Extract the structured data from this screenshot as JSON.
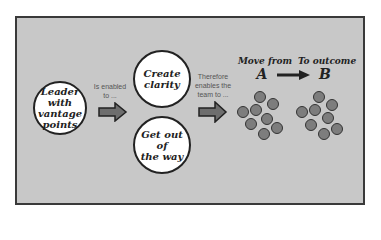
{
  "diagram": {
    "leader": {
      "line1": "Leader with",
      "line2": "vantage",
      "line3": "points"
    },
    "label_enabled": {
      "line1": "Is enabled",
      "line2": "to ..."
    },
    "create": {
      "line1": "Create",
      "line2": "clarity"
    },
    "getout": {
      "line1": "Get out of",
      "line2": "the way"
    },
    "label_therefore": {
      "line1": "Therefore",
      "line2": "enables the",
      "line3": "team to ..."
    },
    "move_from": {
      "label": "Move from",
      "letter": "A"
    },
    "to_outcome": {
      "label": "To outcome",
      "letter": "B"
    },
    "colors": {
      "background": "#c8c8c8",
      "circle_fill": "#ffffff",
      "dot_fill": "#7d7d7d",
      "arrow_fill": "#6e6e6e"
    }
  }
}
